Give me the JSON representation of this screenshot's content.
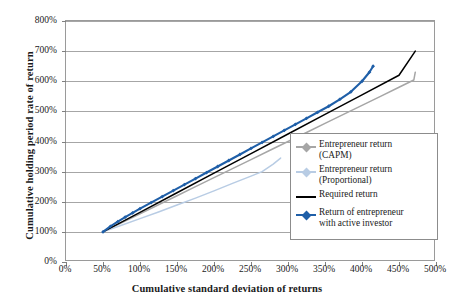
{
  "chart_data": {
    "type": "line",
    "title": "",
    "xlabel": "Cumulative standard deviation of returns",
    "ylabel": "Cumulative holding period rate of return",
    "xlim": [
      0,
      500
    ],
    "ylim": [
      0,
      800
    ],
    "x_ticks": [
      "0%",
      "50%",
      "100%",
      "150%",
      "200%",
      "250%",
      "300%",
      "350%",
      "400%",
      "450%",
      "500%"
    ],
    "x_tick_values": [
      0,
      50,
      100,
      150,
      200,
      250,
      300,
      350,
      400,
      450,
      500
    ],
    "y_ticks": [
      "0%",
      "100%",
      "200%",
      "300%",
      "400%",
      "500%",
      "600%",
      "700%",
      "800%"
    ],
    "y_tick_values": [
      0,
      100,
      200,
      300,
      400,
      500,
      600,
      700,
      800
    ],
    "grid": "horizontal",
    "legend_position": "right-middle",
    "series": [
      {
        "name": "Entrepreneur return (CAPM)",
        "color": "#a6a6a6",
        "marker": "none",
        "points": [
          [
            50,
            100
          ],
          [
            75,
            130
          ],
          [
            100,
            160
          ],
          [
            125,
            190
          ],
          [
            150,
            220
          ],
          [
            175,
            250
          ],
          [
            200,
            280
          ],
          [
            225,
            310
          ],
          [
            250,
            340
          ],
          [
            275,
            370
          ],
          [
            300,
            400
          ],
          [
            325,
            430
          ],
          [
            350,
            460
          ],
          [
            375,
            490
          ],
          [
            400,
            520
          ],
          [
            425,
            550
          ],
          [
            450,
            580
          ],
          [
            470,
            604
          ],
          [
            472,
            630
          ]
        ]
      },
      {
        "name": "Entrepreneur return (Proportional)",
        "color": "#b8cce4",
        "marker": "none",
        "points": [
          [
            50,
            100
          ],
          [
            75,
            122
          ],
          [
            100,
            144
          ],
          [
            125,
            166
          ],
          [
            150,
            189
          ],
          [
            175,
            212
          ],
          [
            200,
            236
          ],
          [
            225,
            261
          ],
          [
            250,
            285
          ],
          [
            265,
            300
          ],
          [
            280,
            325
          ],
          [
            290,
            345
          ]
        ]
      },
      {
        "name": "Required return",
        "color": "#000000",
        "marker": "none",
        "points": [
          [
            50,
            100
          ],
          [
            100,
            165
          ],
          [
            150,
            230
          ],
          [
            200,
            295
          ],
          [
            250,
            360
          ],
          [
            300,
            425
          ],
          [
            350,
            490
          ],
          [
            400,
            555
          ],
          [
            450,
            620
          ],
          [
            472,
            700
          ]
        ]
      },
      {
        "name": "Return of entrepreneur with active investor",
        "color": "#1f5fa8",
        "marker": "diamond",
        "points": [
          [
            50,
            100
          ],
          [
            60,
            118
          ],
          [
            70,
            134
          ],
          [
            80,
            149
          ],
          [
            90,
            163
          ],
          [
            100,
            177
          ],
          [
            115,
            197
          ],
          [
            130,
            217
          ],
          [
            145,
            237
          ],
          [
            160,
            257
          ],
          [
            175,
            277
          ],
          [
            190,
            297
          ],
          [
            205,
            317
          ],
          [
            220,
            337
          ],
          [
            235,
            357
          ],
          [
            250,
            377
          ],
          [
            265,
            397
          ],
          [
            280,
            417
          ],
          [
            295,
            437
          ],
          [
            310,
            457
          ],
          [
            325,
            477
          ],
          [
            340,
            497
          ],
          [
            355,
            517
          ],
          [
            370,
            540
          ],
          [
            385,
            565
          ],
          [
            400,
            600
          ],
          [
            410,
            630
          ],
          [
            415,
            650
          ]
        ]
      }
    ]
  },
  "legend": {
    "entries": [
      {
        "label": "Entrepreneur return\n(CAPM)",
        "color": "#a6a6a6",
        "marker": "line-dot"
      },
      {
        "label": "Entrepreneur return\n(Proportional)",
        "color": "#b8cce4",
        "marker": "line-dot"
      },
      {
        "label": "Required return",
        "color": "#000000",
        "marker": "line"
      },
      {
        "label": "Return of entrepreneur\nwith active investor",
        "color": "#1f5fa8",
        "marker": "line-diamond"
      }
    ]
  },
  "colors": {
    "capm": "#a6a6a6",
    "proportional": "#b8cce4",
    "required": "#000000",
    "active_investor": "#1f5fa8",
    "grid": "#a6a6a6",
    "frame": "#9a9a9a",
    "text": "#1a1a1a"
  }
}
